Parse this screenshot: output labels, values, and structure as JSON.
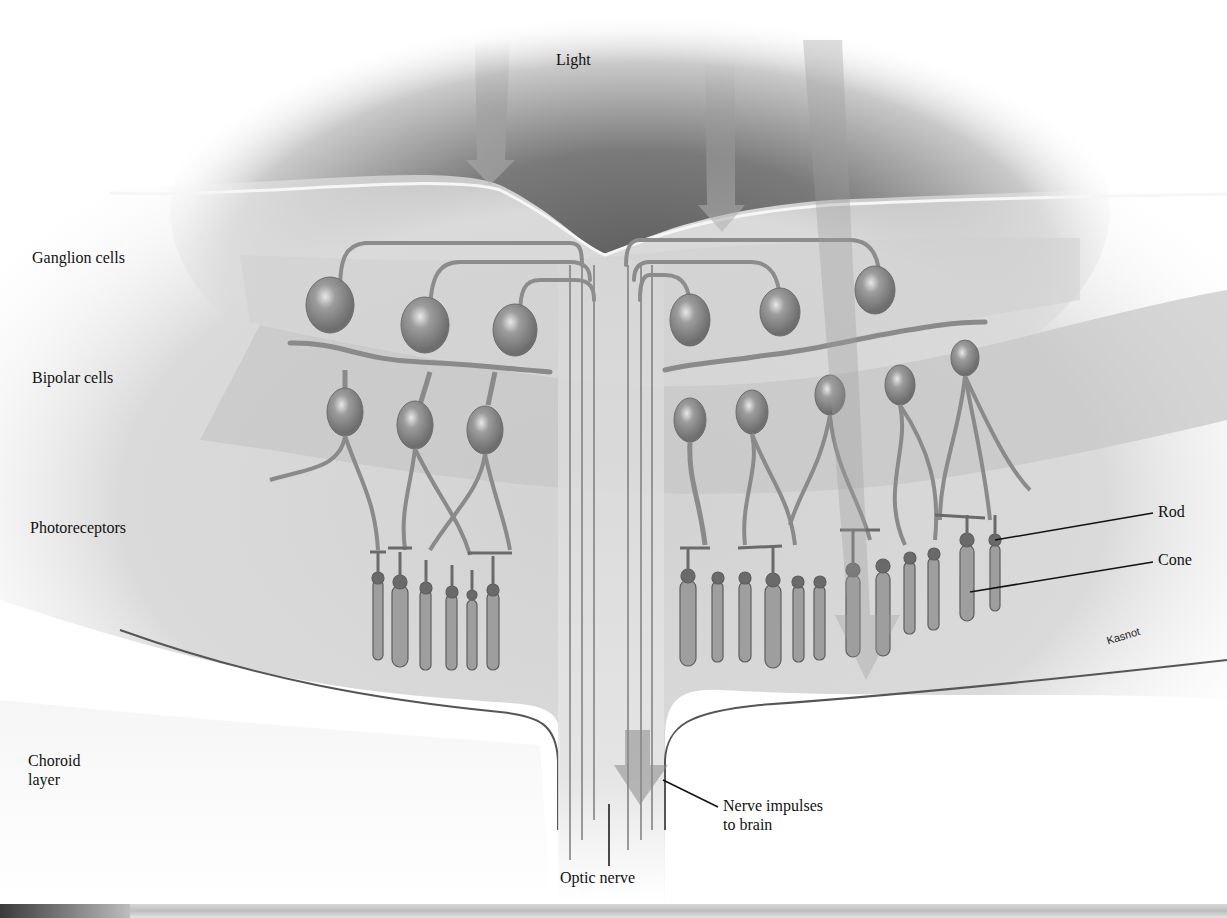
{
  "figure": {
    "top_label": "Light",
    "layer_labels": [
      {
        "id": "ganglion",
        "text": "Ganglion cells"
      },
      {
        "id": "bipolar",
        "text": "Bipolar cells"
      },
      {
        "id": "photoreceptors",
        "text": "Photoreceptors"
      },
      {
        "id": "choroid_line1",
        "text": "Choroid"
      },
      {
        "id": "choroid_line2",
        "text": "layer"
      }
    ],
    "callouts": {
      "rod": "Rod",
      "cone": "Cone",
      "nerve_line1": "Nerve impulses",
      "nerve_line2": "to brain",
      "optic_nerve": "Optic nerve"
    },
    "signature": "Kasnot",
    "colors": {
      "background": "#ffffff",
      "dark_field": "#6b6b6b",
      "layer_light": "#e2e2e2",
      "layer_mid": "#cfcfcf",
      "cell_fill": "#a9a9a9",
      "cell_stroke": "#7a7a7a",
      "text": "#111111"
    }
  }
}
